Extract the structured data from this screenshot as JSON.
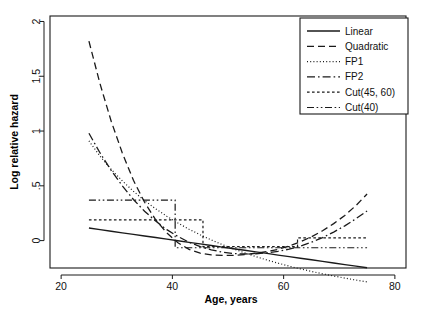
{
  "chart_data": {
    "type": "line",
    "title": "",
    "xlabel": "Age, years",
    "ylabel": "Log relative hazard",
    "xlim": [
      18,
      82
    ],
    "ylim": [
      -0.25,
      2.05
    ],
    "xticks": [
      20,
      40,
      60,
      80
    ],
    "xtick_labels": [
      "20",
      "40",
      "60",
      "80"
    ],
    "yticks": [
      0,
      0.5,
      1,
      1.5,
      2
    ],
    "ytick_labels": [
      "0",
      ".5",
      "1",
      "1.5",
      "2"
    ],
    "grid": false,
    "legend_position": "top-right",
    "x": [
      25,
      27,
      29,
      31,
      33,
      35,
      37,
      39,
      41,
      43,
      45,
      47,
      49,
      51,
      53,
      55,
      57,
      59,
      61,
      63,
      65,
      67,
      69,
      71,
      73,
      75
    ],
    "series": [
      {
        "name": "Linear",
        "dash": "solid",
        "values": [
          0.115,
          0.1,
          0.086,
          0.071,
          0.057,
          0.042,
          0.028,
          0.013,
          -0.001,
          -0.016,
          -0.03,
          -0.045,
          -0.059,
          -0.074,
          -0.088,
          -0.103,
          -0.117,
          -0.132,
          -0.146,
          -0.161,
          -0.175,
          -0.19,
          -0.204,
          -0.219,
          -0.233,
          -0.248
        ]
      },
      {
        "name": "Quadratic",
        "dash": "dashed",
        "values": [
          1.82,
          1.43,
          1.09,
          0.8,
          0.55,
          0.35,
          0.19,
          0.07,
          -0.02,
          -0.08,
          -0.115,
          -0.13,
          -0.135,
          -0.135,
          -0.128,
          -0.115,
          -0.1,
          -0.08,
          -0.05,
          -0.012,
          0.035,
          0.09,
          0.155,
          0.23,
          0.32,
          0.425
        ]
      },
      {
        "name": "FP1",
        "dash": "dotted",
        "values": [
          0.91,
          0.77,
          0.65,
          0.545,
          0.45,
          0.365,
          0.29,
          0.222,
          0.16,
          0.104,
          0.053,
          0.006,
          -0.037,
          -0.076,
          -0.112,
          -0.146,
          -0.177,
          -0.206,
          -0.233,
          -0.258,
          -0.281,
          -0.303,
          -0.323,
          -0.342,
          -0.36,
          -0.377
        ]
      },
      {
        "name": "FP2",
        "dash": "dashdot",
        "values": [
          0.98,
          0.8,
          0.64,
          0.5,
          0.375,
          0.268,
          0.178,
          0.1,
          0.038,
          -0.015,
          -0.055,
          -0.085,
          -0.105,
          -0.118,
          -0.122,
          -0.12,
          -0.112,
          -0.098,
          -0.078,
          -0.05,
          -0.015,
          0.028,
          0.078,
          0.135,
          0.2,
          0.27
        ]
      },
      {
        "name": "Cut(45, 60)",
        "dash": "fine-dotted",
        "values": [
          0.19,
          0.19,
          0.19,
          0.19,
          0.19,
          0.19,
          0.19,
          0.19,
          0.19,
          0.19,
          0.19,
          -0.055,
          -0.055,
          -0.055,
          -0.055,
          -0.055,
          -0.055,
          -0.055,
          -0.055,
          0.025,
          0.025,
          0.025,
          0.025,
          0.025,
          0.025,
          0.025
        ]
      },
      {
        "name": "Cut(40)",
        "dash": "dashdotdot",
        "values": [
          0.37,
          0.37,
          0.37,
          0.37,
          0.37,
          0.37,
          0.37,
          0.37,
          -0.065,
          -0.065,
          -0.065,
          -0.065,
          -0.065,
          -0.065,
          -0.065,
          -0.065,
          -0.065,
          -0.065,
          -0.065,
          -0.065,
          -0.065,
          -0.065,
          -0.065,
          -0.065,
          -0.065,
          -0.065
        ]
      }
    ],
    "step_details": {
      "cut_45_60_breaks": [
        45.5,
        62.5
      ],
      "cut_45_60_levels": [
        0.19,
        -0.055,
        0.025
      ],
      "cut_40_breaks": [
        40.5
      ],
      "cut_40_levels": [
        0.37,
        -0.065
      ]
    },
    "legend_entries": [
      {
        "label": "Linear",
        "dash": "solid"
      },
      {
        "label": "Quadratic",
        "dash": "dashed"
      },
      {
        "label": "FP1",
        "dash": "dotted"
      },
      {
        "label": "FP2",
        "dash": "dashdot"
      },
      {
        "label": "Cut(45, 60)",
        "dash": "fine-dotted"
      },
      {
        "label": "Cut(40)",
        "dash": "dashdotdot"
      }
    ],
    "line_color": "#1a1a1a"
  }
}
